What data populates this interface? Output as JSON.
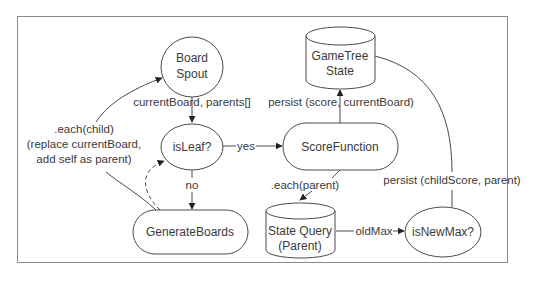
{
  "diagram": {
    "nodes": {
      "board_spout": {
        "line1": "Board",
        "line2": "Spout",
        "shape": "ellipse"
      },
      "is_leaf": {
        "label": "isLeaf?",
        "shape": "ellipse"
      },
      "score_function": {
        "label": "ScoreFunction",
        "shape": "rounded-rect"
      },
      "gametree_state": {
        "line1": "GameTree",
        "line2": "State",
        "shape": "cylinder"
      },
      "generate_boards": {
        "label": "GenerateBoards",
        "shape": "rounded-rect"
      },
      "state_query": {
        "line1": "State Query",
        "line2": "(Parent)",
        "shape": "cylinder"
      },
      "is_new_max": {
        "label": "isNewMax?",
        "shape": "ellipse"
      }
    },
    "edges": {
      "spout_to_isleaf": {
        "label": "currentBoard, parents[]"
      },
      "isleaf_to_score": {
        "label": "yes"
      },
      "isleaf_to_generate": {
        "label": "no"
      },
      "score_to_gametree": {
        "label": "persist (score, currentBoard)"
      },
      "score_to_statequery": {
        "label": ".each(parent)"
      },
      "statequery_to_newmax": {
        "label": "oldMax"
      },
      "newmax_to_gametree": {
        "label": "persist (childScore, parent)"
      },
      "generate_to_spout": {
        "line1": ".each(child)",
        "line2": "(replace currentBoard,",
        "line3": "add self as parent)"
      },
      "generate_to_isleaf": {
        "label": "",
        "style": "dashed"
      }
    },
    "colors": {
      "stroke": "#4a4a4a",
      "text": "#3a3a3a",
      "frame": "#8a8a8a",
      "background": "#ffffff"
    }
  }
}
